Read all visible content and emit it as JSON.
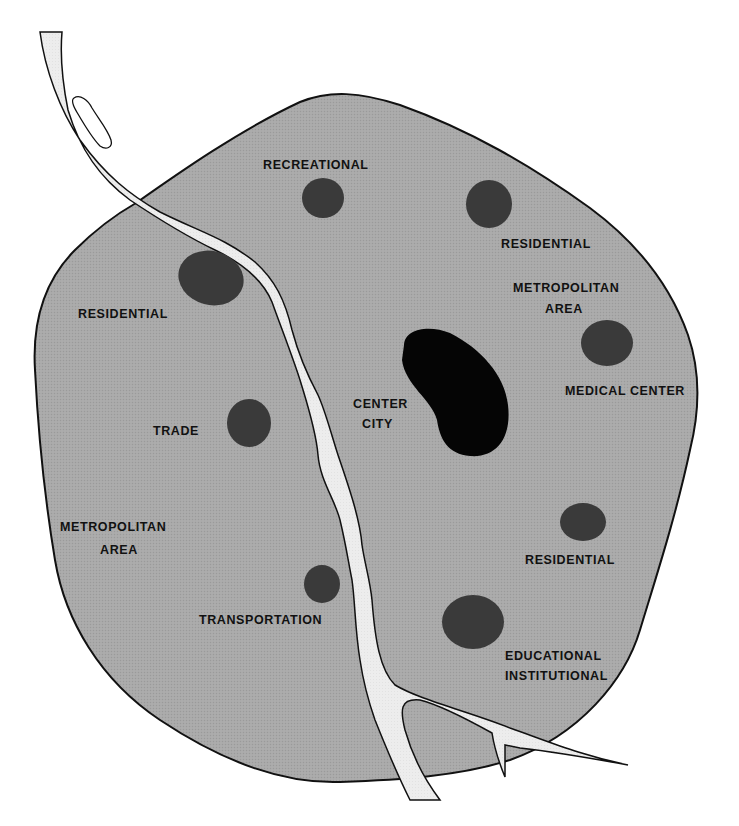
{
  "diagram": {
    "type": "urban-land-use-map",
    "colors": {
      "background": "#ffffff",
      "metro_area_fill": "#a8a8a8",
      "outline": "#111111",
      "river_fill": "#ececec",
      "land_use_node": "#3a3a3a",
      "center_city": "#050505"
    },
    "labels": {
      "recreational": "RECREATIONAL",
      "residential_ne": "RESIDENTIAL",
      "residential_nw": "RESIDENTIAL",
      "metro_area_ne_1": "METROPOLITAN",
      "metro_area_ne_2": "AREA",
      "medical_center": "MEDICAL CENTER",
      "center_city_1": "CENTER",
      "center_city_2": "CITY",
      "trade": "TRADE",
      "metro_area_w_1": "METROPOLITAN",
      "metro_area_w_2": "AREA",
      "residential_se": "RESIDENTIAL",
      "transportation": "TRANSPORTATION",
      "educational_1": "EDUCATIONAL",
      "educational_2": "INSTITUTIONAL"
    },
    "nodes": [
      {
        "id": "recreational",
        "label": "RECREATIONAL"
      },
      {
        "id": "residential-ne",
        "label": "RESIDENTIAL"
      },
      {
        "id": "residential-nw",
        "label": "RESIDENTIAL"
      },
      {
        "id": "medical-center",
        "label": "MEDICAL CENTER"
      },
      {
        "id": "center-city",
        "label": "CENTER CITY"
      },
      {
        "id": "trade",
        "label": "TRADE"
      },
      {
        "id": "residential-se",
        "label": "RESIDENTIAL"
      },
      {
        "id": "transportation",
        "label": "TRANSPORTATION"
      },
      {
        "id": "educational-institutional",
        "label": "EDUCATIONAL INSTITUTIONAL"
      }
    ],
    "regions": [
      {
        "id": "metropolitan-area",
        "label": "METROPOLITAN AREA"
      },
      {
        "id": "river",
        "label": ""
      }
    ]
  }
}
